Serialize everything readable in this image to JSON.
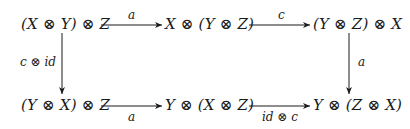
{
  "diagram": {
    "type": "commutative-diagram",
    "nodes": {
      "top_left": "(X ⊗ Y) ⊗ Z",
      "top_mid": "X ⊗ (Y ⊗ Z)",
      "top_right": "(Y ⊗ Z) ⊗ X",
      "bot_left": "(Y ⊗ X) ⊗ Z",
      "bot_mid": "Y ⊗ (X ⊗ Z)",
      "bot_right": "Y ⊗ (Z ⊗ X)"
    },
    "arrows": {
      "top_left_to_top_mid": "a",
      "top_mid_to_top_right": "c",
      "top_left_to_bot_left": "c ⊗ id",
      "top_right_to_bot_right": "a",
      "bot_left_to_bot_mid": "a",
      "bot_mid_to_bot_right": "id ⊗ c"
    }
  }
}
